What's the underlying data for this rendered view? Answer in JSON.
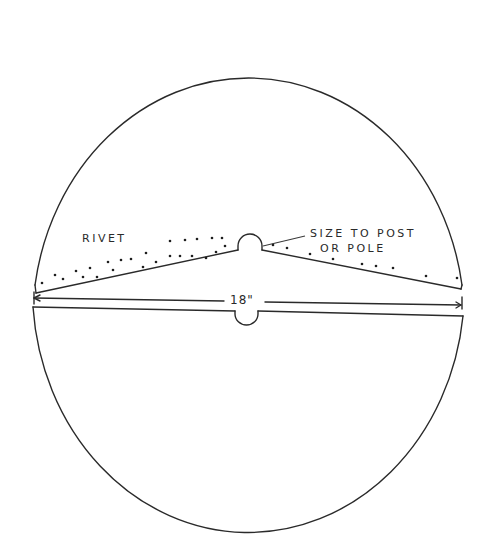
{
  "diagram": {
    "type": "pattern-template",
    "labels": {
      "rivet": "RIVET",
      "size_line1": "SIZE TO POST",
      "size_line2": "OR POLE",
      "dimension": "18\""
    },
    "parts": [
      {
        "name": "upper-half",
        "description": "upper semicircle with wedge-shaped overlap cut and semicircular notch for post"
      },
      {
        "name": "lower-half",
        "description": "lower semicircle with straight edge and semicircular notch for post"
      }
    ],
    "dimension": {
      "value": "18\"",
      "spans": "full diameter"
    },
    "colors": {
      "line": "#2a2a2a",
      "background": "#ffffff"
    }
  },
  "geometry": {
    "circle": {
      "cx": 248,
      "cy": 279,
      "rx": 216,
      "ry": 244
    },
    "rivet_dots_left": [
      [
        42,
        283
      ],
      [
        55,
        275
      ],
      [
        63,
        279
      ],
      [
        76,
        271
      ],
      [
        83,
        277
      ],
      [
        90,
        268
      ],
      [
        97,
        277
      ],
      [
        108,
        262
      ],
      [
        113,
        270
      ],
      [
        121,
        260
      ],
      [
        131,
        259
      ],
      [
        143,
        267
      ],
      [
        146,
        253
      ],
      [
        156,
        262
      ],
      [
        170,
        256
      ],
      [
        170,
        241
      ],
      [
        180,
        256
      ],
      [
        185,
        240
      ],
      [
        192,
        256
      ],
      [
        197,
        239
      ],
      [
        206,
        258
      ],
      [
        212,
        238
      ],
      [
        216,
        252
      ],
      [
        222,
        238
      ],
      [
        225,
        246
      ]
    ],
    "rivet_dots_right": [
      [
        273,
        245
      ],
      [
        287,
        248
      ],
      [
        310,
        254
      ],
      [
        333,
        259
      ],
      [
        362,
        264
      ],
      [
        376,
        266
      ],
      [
        393,
        268
      ],
      [
        426,
        276
      ],
      [
        457,
        278
      ]
    ]
  }
}
